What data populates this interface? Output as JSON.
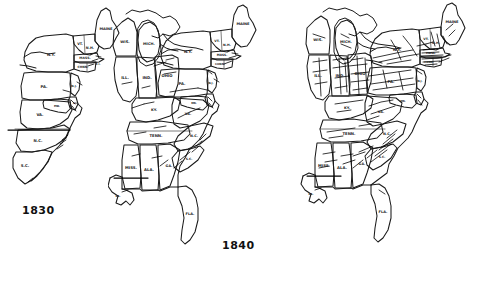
{
  "figure": {
    "background_color": "#ffffff",
    "ink_color": "#1a1a1a"
  },
  "panels": [
    {
      "id": "panel-1830",
      "year": "1830",
      "state_labels": [
        {
          "name": "MAINE",
          "abbr": "MAINE"
        },
        {
          "name": "Vermont",
          "abbr": "VT."
        },
        {
          "name": "New Hampshire",
          "abbr": "N.H."
        },
        {
          "name": "Massachusetts",
          "abbr": "MASS."
        },
        {
          "name": "Connecticut",
          "abbr": "CONN."
        },
        {
          "name": "Rhode Island",
          "abbr": "R.I."
        },
        {
          "name": "New York",
          "abbr": "N.Y."
        },
        {
          "name": "Pennsylvania",
          "abbr": "PA."
        },
        {
          "name": "New Jersey",
          "abbr": "N.J."
        },
        {
          "name": "Maryland",
          "abbr": "MD."
        },
        {
          "name": "Delaware",
          "abbr": "DEL."
        },
        {
          "name": "Virginia",
          "abbr": "VA."
        },
        {
          "name": "North Carolina",
          "abbr": "N.C."
        },
        {
          "name": "South Carolina",
          "abbr": "S.C."
        }
      ]
    },
    {
      "id": "panel-1840",
      "year": "1840",
      "state_labels": [
        {
          "name": "MAINE",
          "abbr": "MAINE"
        },
        {
          "name": "Vermont",
          "abbr": "VT."
        },
        {
          "name": "New Hampshire",
          "abbr": "N.H."
        },
        {
          "name": "Massachusetts",
          "abbr": "MASS."
        },
        {
          "name": "Connecticut",
          "abbr": "CONN."
        },
        {
          "name": "New York",
          "abbr": "N.Y."
        },
        {
          "name": "Pennsylvania",
          "abbr": "PA."
        },
        {
          "name": "New Jersey",
          "abbr": "N.J."
        },
        {
          "name": "Maryland",
          "abbr": "MD."
        },
        {
          "name": "Virginia",
          "abbr": "VA."
        },
        {
          "name": "Wisconsin",
          "abbr": "WIS."
        },
        {
          "name": "Michigan",
          "abbr": "MICH."
        },
        {
          "name": "Illinois",
          "abbr": "ILL."
        },
        {
          "name": "Indiana",
          "abbr": "IND."
        },
        {
          "name": "Ohio",
          "abbr": "OHIO"
        },
        {
          "name": "Kentucky",
          "abbr": "KY."
        },
        {
          "name": "Tennessee",
          "abbr": "TENN."
        },
        {
          "name": "Mississippi",
          "abbr": "MISS."
        },
        {
          "name": "Alabama",
          "abbr": "ALA."
        },
        {
          "name": "Georgia",
          "abbr": "GA."
        },
        {
          "name": "North Carolina",
          "abbr": "N.C."
        },
        {
          "name": "South Carolina",
          "abbr": "S.C."
        },
        {
          "name": "Florida",
          "abbr": "FLA."
        },
        {
          "name": "Louisiana",
          "abbr": "LA."
        }
      ]
    },
    {
      "id": "panel-1850",
      "year": "1850",
      "state_labels": [
        {
          "name": "MAINE",
          "abbr": "MAINE"
        },
        {
          "name": "Vermont",
          "abbr": "VT."
        },
        {
          "name": "New Hampshire",
          "abbr": "N.H."
        },
        {
          "name": "Massachusetts",
          "abbr": "MASS."
        },
        {
          "name": "Connecticut",
          "abbr": "CONN."
        },
        {
          "name": "New York",
          "abbr": "N.Y."
        },
        {
          "name": "Pennsylvania",
          "abbr": "PA."
        },
        {
          "name": "New Jersey",
          "abbr": "N.J."
        },
        {
          "name": "Maryland",
          "abbr": "MD."
        },
        {
          "name": "Virginia",
          "abbr": "VA."
        },
        {
          "name": "Wisconsin",
          "abbr": "WIS."
        },
        {
          "name": "Michigan",
          "abbr": "MICH."
        },
        {
          "name": "Illinois",
          "abbr": "ILL."
        },
        {
          "name": "Indiana",
          "abbr": "IND."
        },
        {
          "name": "Ohio",
          "abbr": "OHIO"
        },
        {
          "name": "Kentucky",
          "abbr": "KY."
        },
        {
          "name": "Tennessee",
          "abbr": "TENN."
        },
        {
          "name": "Mississippi",
          "abbr": "MISS."
        },
        {
          "name": "Alabama",
          "abbr": "ALA."
        },
        {
          "name": "Georgia",
          "abbr": "GA."
        },
        {
          "name": "North Carolina",
          "abbr": "N.C."
        },
        {
          "name": "South Carolina",
          "abbr": "S.C."
        },
        {
          "name": "Florida",
          "abbr": "FLA."
        },
        {
          "name": "Louisiana",
          "abbr": "LA."
        }
      ]
    }
  ]
}
